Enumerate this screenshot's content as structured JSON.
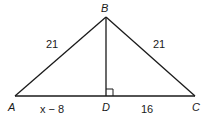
{
  "figure": {
    "type": "triangle",
    "vertices": {
      "A": {
        "label": "A"
      },
      "B": {
        "label": "B"
      },
      "C": {
        "label": "C"
      },
      "D": {
        "label": "D"
      }
    },
    "segments": {
      "AB": {
        "label": "21"
      },
      "BC": {
        "label": "21"
      },
      "AD": {
        "label": "x − 8"
      },
      "DC": {
        "label": "16"
      }
    },
    "right_angle_at": "D",
    "stroke_color": "#1a1a1a"
  }
}
